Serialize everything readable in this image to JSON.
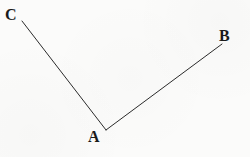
{
  "figure": {
    "kind": "angle-diagram",
    "background_color": "#fbfbfa",
    "stroke_color": "#2b2b2b",
    "label_color": "#1a1a1a",
    "stroke_width": 1,
    "canvas": {
      "width": 250,
      "height": 157
    },
    "points": {
      "A": {
        "label": "A",
        "x": 106,
        "y": 130
      },
      "B": {
        "label": "B",
        "x": 222,
        "y": 44
      },
      "C": {
        "label": "C",
        "x": 22,
        "y": 21
      }
    },
    "segments": [
      {
        "name": "ray-AC",
        "from": "A",
        "to": "C",
        "path": "M 106 130 L 22 21"
      },
      {
        "name": "ray-AB",
        "from": "A",
        "to": "B",
        "path": "M 106 130 L 222 44"
      }
    ],
    "labels": {
      "A": "A",
      "B": "B",
      "C": "C"
    }
  }
}
